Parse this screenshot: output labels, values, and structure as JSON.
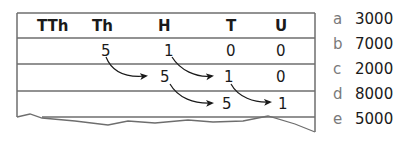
{
  "table": {
    "headers": [
      "TTh",
      "Th",
      "H",
      "T",
      "U"
    ],
    "rows": [
      [
        "",
        "5",
        "1",
        "0",
        "0"
      ],
      [
        "",
        "",
        "5",
        "1",
        "0"
      ],
      [
        "",
        "",
        "",
        "5",
        "1"
      ]
    ],
    "arrows": [
      {
        "from": [
          0,
          "Th"
        ],
        "to": [
          1,
          "H"
        ]
      },
      {
        "from": [
          0,
          "H"
        ],
        "to": [
          1,
          "T"
        ]
      },
      {
        "from": [
          1,
          "H"
        ],
        "to": [
          2,
          "T"
        ]
      },
      {
        "from": [
          1,
          "T"
        ],
        "to": [
          2,
          "U"
        ]
      }
    ]
  },
  "answers": [
    {
      "letter": "a",
      "value": "3000"
    },
    {
      "letter": "b",
      "value": "7000"
    },
    {
      "letter": "c",
      "value": "2000"
    },
    {
      "letter": "d",
      "value": "8000"
    },
    {
      "letter": "e",
      "value": "5000"
    }
  ],
  "colors": {
    "line": "#6e6e6e",
    "text": "#1a1a1a",
    "letter": "#7a7a7a"
  }
}
